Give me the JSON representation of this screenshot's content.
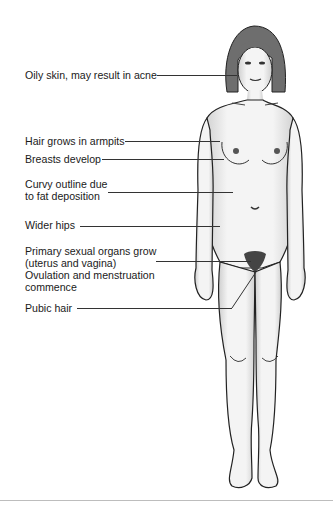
{
  "diagram": {
    "labels": [
      {
        "id": "oily-skin",
        "text": "Oily skin, may result in acne"
      },
      {
        "id": "armpit-hair",
        "text": "Hair grows in armpits"
      },
      {
        "id": "breasts",
        "text": "Breasts develop"
      },
      {
        "id": "curvy-outline",
        "text": "Curvy outline due\nto fat deposition",
        "lines": [
          "Curvy outline due",
          "to fat deposition"
        ]
      },
      {
        "id": "wider-hips",
        "text": "Wider hips"
      },
      {
        "id": "primary-organs",
        "lines": [
          "Primary sexual organs grow",
          "(uterus and vagina)",
          "Ovulation and menstruation",
          "commence"
        ]
      },
      {
        "id": "pubic-hair",
        "text": "Pubic hair"
      }
    ],
    "colors": {
      "ink": "#1a1a1a",
      "skin_shade": "#c8c8c8",
      "rule": "#bdbdbd"
    }
  }
}
